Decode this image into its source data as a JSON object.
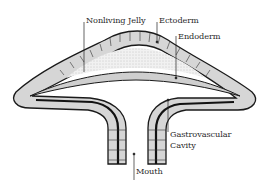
{
  "diagram": {
    "labels": {
      "nonliving_jelly": "Nonliving Jelly",
      "ectoderm": "Ectoderm",
      "endoderm": "Endoderm",
      "gastrovascular_line1": "Gastrovascular",
      "gastrovascular_line2": "Cavity",
      "mouth": "Mouth"
    },
    "colors": {
      "outline": "#1a1a1a",
      "cell_fill": "#d9d9d9",
      "jelly_fill": "#ececec",
      "background": "#ffffff"
    }
  }
}
